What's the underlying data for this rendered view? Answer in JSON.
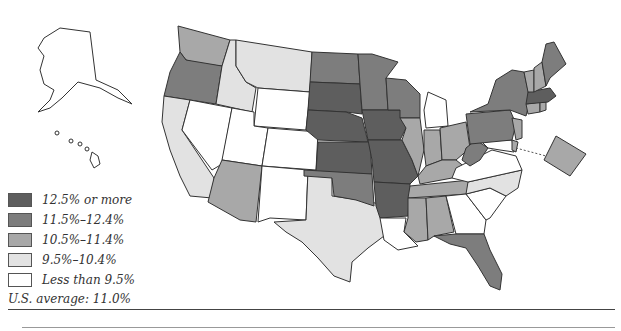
{
  "legend": {
    "items": [
      {
        "label": "12.5% or more",
        "color": "#5e5e5e",
        "class": "c4"
      },
      {
        "label": "11.5%–12.4%",
        "color": "#7d7d7d",
        "class": "c3"
      },
      {
        "label": "10.5%–11.4%",
        "color": "#a8a8a8",
        "class": "c2"
      },
      {
        "label": "9.5%–10.4%",
        "color": "#e2e2e2",
        "class": "c1"
      },
      {
        "label": "Less than 9.5%",
        "color": "#ffffff",
        "class": "c0"
      }
    ]
  },
  "summary": {
    "us_average": "U.S. average: 11.0%"
  },
  "map_data": {
    "type": "choropleth",
    "region": "United States",
    "states": {
      "AK": "Less than 9.5%",
      "HI": "Less than 9.5%",
      "WA": "10.5%–11.4%",
      "OR": "11.5%–12.4%",
      "CA": "9.5%–10.4%",
      "ID": "9.5%–10.4%",
      "MT": "9.5%–10.4%",
      "WY": "Less than 9.5%",
      "NV": "Less than 9.5%",
      "UT": "Less than 9.5%",
      "CO": "Less than 9.5%",
      "AZ": "10.5%–11.4%",
      "NM": "Less than 9.5%",
      "TX": "9.5%–10.4%",
      "ND": "11.5%–12.4%",
      "SD": "12.5% or more",
      "NE": "12.5% or more",
      "KS": "12.5% or more",
      "OK": "11.5%–12.4%",
      "MN": "11.5%–12.4%",
      "IA": "12.5% or more",
      "MO": "12.5% or more",
      "AR": "12.5% or more",
      "LA": "Less than 9.5%",
      "WI": "11.5%–12.4%",
      "IL": "10.5%–11.4%",
      "MI": "Less than 9.5%",
      "IN": "10.5%–11.4%",
      "OH": "10.5%–11.4%",
      "KY": "10.5%–11.4%",
      "TN": "10.5%–11.4%",
      "MS": "10.5%–11.4%",
      "AL": "10.5%–11.4%",
      "GA": "Less than 9.5%",
      "FL": "11.5%–12.4%",
      "SC": "Less than 9.5%",
      "NC": "9.5%–10.4%",
      "VA": "Less than 9.5%",
      "WV": "11.5%–12.4%",
      "MD": "Less than 9.5%",
      "DE": "10.5%–11.4%",
      "PA": "11.5%–12.4%",
      "NJ": "10.5%–11.4%",
      "NY": "11.5%–12.4%",
      "CT": "10.5%–11.4%",
      "RI": "10.5%–11.4%",
      "MA": "12.5% or more",
      "VT": "10.5%–11.4%",
      "NH": "10.5%–11.4%",
      "ME": "11.5%–12.4%",
      "DC": "10.5%–11.4%"
    }
  }
}
